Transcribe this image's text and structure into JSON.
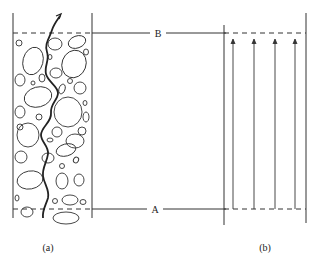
{
  "diagram": {
    "panel_a": {
      "caption": "(a)",
      "description": "Porous medium with irregular grains and a tortuous flow path"
    },
    "panel_b": {
      "caption": "(b)",
      "description": "Idealized straight parallel flow lines"
    },
    "labels": {
      "top": "B",
      "bottom": "A"
    },
    "colors": {
      "line": "#333333",
      "background": "#ffffff"
    }
  }
}
